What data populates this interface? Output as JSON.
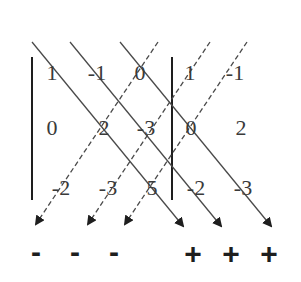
{
  "diagram": {
    "matrix": [
      [
        "1",
        "-1",
        "0"
      ],
      [
        "0",
        "2",
        "-3"
      ],
      [
        "-2",
        "-3",
        "5"
      ]
    ],
    "repeated_columns": [
      [
        "1",
        "-1"
      ],
      [
        "0",
        "2"
      ],
      [
        "-2",
        "-3"
      ]
    ],
    "signs": {
      "negative": [
        "-",
        "-",
        "-"
      ],
      "positive": [
        "+",
        "+",
        "+"
      ]
    },
    "colors": {
      "text": "#3a3a3a",
      "lines": "#4a4a4a",
      "background": "#ffffff"
    }
  }
}
